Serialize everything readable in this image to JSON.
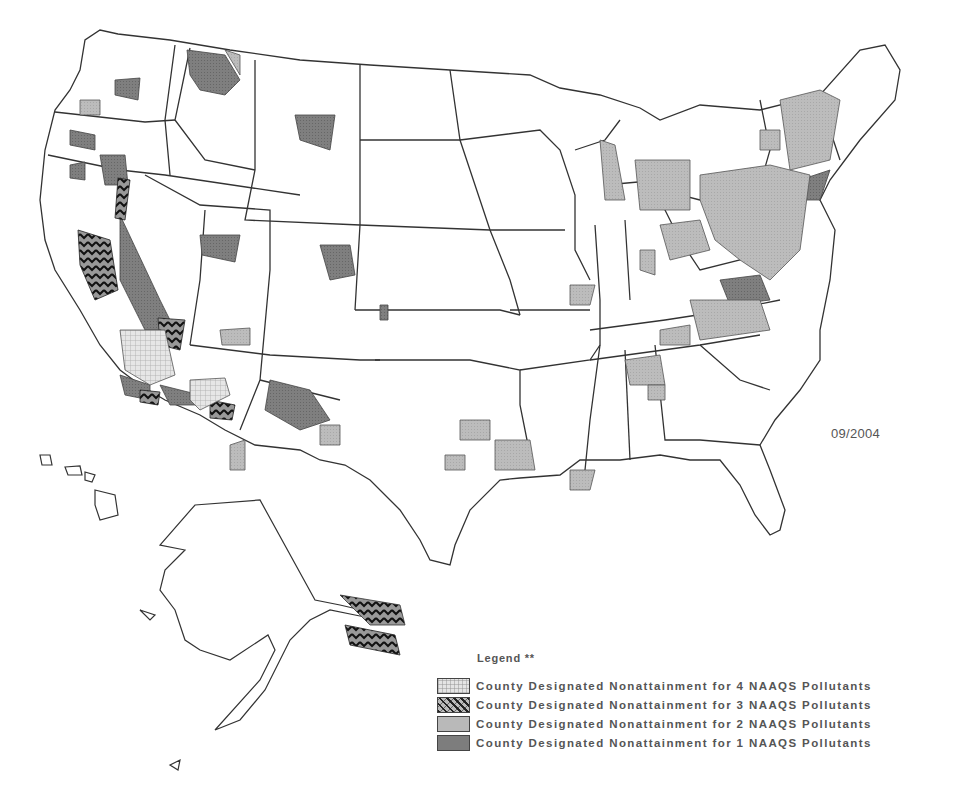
{
  "map": {
    "title": "County Designated Nonattainment Areas for NAAQS Pollutants",
    "date": "09/2004",
    "colors": {
      "background": "#ffffff",
      "state_border": "#333333",
      "four_pollutants": "#e4e4e4",
      "three_pollutants": "#222222",
      "two_pollutants": "#b9b9b9",
      "one_pollutant": "#7d7d7d"
    },
    "regions_shown": [
      "Contiguous United States",
      "Alaska",
      "Hawaii"
    ]
  },
  "legend": {
    "title": "Legend **",
    "items": [
      {
        "label": "County Designated Nonattainment for 4 NAAQS Pollutants",
        "swatch": "light-crosshatch"
      },
      {
        "label": "County Designated Nonattainment for 3 NAAQS Pollutants",
        "swatch": "dark-chevron"
      },
      {
        "label": "County Designated Nonattainment for 2 NAAQS Pollutants",
        "swatch": "light-gray"
      },
      {
        "label": "County Designated Nonattainment for 1 NAAQS Pollutants",
        "swatch": "dark-gray"
      }
    ]
  }
}
